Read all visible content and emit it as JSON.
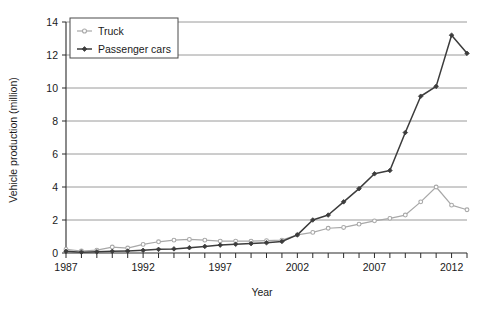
{
  "chart_data": {
    "type": "line",
    "title": "",
    "xlabel": "Year",
    "ylabel": "Vehicle production (million)",
    "xlim": [
      1987,
      2013
    ],
    "ylim": [
      0,
      14
    ],
    "ytick_step": 2,
    "xtick_step": 1,
    "xtick_label_step": 5,
    "grid": "horizontal",
    "legend_position": "top-left",
    "x": [
      1987,
      1988,
      1989,
      1990,
      1991,
      1992,
      1993,
      1994,
      1995,
      1996,
      1997,
      1998,
      1999,
      2000,
      2001,
      2002,
      2003,
      2004,
      2005,
      2006,
      2007,
      2008,
      2009,
      2010,
      2011,
      2012,
      2013
    ],
    "xtick_labels": [
      "1987",
      "1992",
      "1997",
      "2002",
      "2007",
      "2012"
    ],
    "ytick_labels": [
      "0",
      "2",
      "4",
      "6",
      "8",
      "10",
      "12",
      "14"
    ],
    "series": [
      {
        "name": "Truck",
        "color": "#a8a8a8",
        "marker": "open-circle",
        "values": [
          0.22,
          0.12,
          0.17,
          0.36,
          0.3,
          0.52,
          0.68,
          0.78,
          0.82,
          0.78,
          0.72,
          0.72,
          0.72,
          0.75,
          0.78,
          1.1,
          1.25,
          1.5,
          1.55,
          1.75,
          1.95,
          2.1,
          2.3,
          3.1,
          4.0,
          2.9,
          2.62
        ]
      },
      {
        "name": "Passenger cars",
        "color": "#3c3c3c",
        "marker": "filled-diamond",
        "values": [
          0.1,
          0.05,
          0.07,
          0.1,
          0.12,
          0.16,
          0.22,
          0.25,
          0.32,
          0.4,
          0.48,
          0.53,
          0.57,
          0.62,
          0.7,
          1.1,
          2.0,
          2.3,
          3.1,
          3.9,
          4.8,
          5.0,
          7.3,
          9.5,
          10.1,
          13.2,
          12.1
        ]
      }
    ]
  },
  "legend": {
    "items": [
      {
        "label": "Truck"
      },
      {
        "label": "Passenger cars"
      }
    ]
  },
  "axes": {
    "y_title": "Vehicle production (million)",
    "x_title": "Year"
  }
}
